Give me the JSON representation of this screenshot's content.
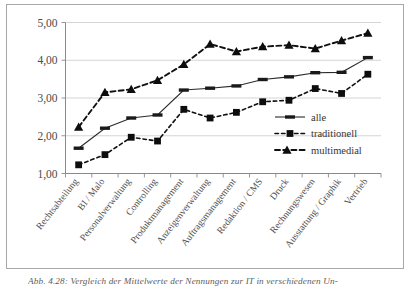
{
  "figure": {
    "caption": "Abb. 4.28: Vergleich der Mittelwerte der Nennungen zur IT in verschiedenen Un-"
  },
  "chart_data": {
    "type": "line",
    "title": "",
    "xlabel": "",
    "ylabel": "",
    "ylim": [
      1.0,
      5.0
    ],
    "ytick_labels": [
      "1,00",
      "2,00",
      "3,00",
      "4,00",
      "5,00"
    ],
    "ytick_values": [
      1.0,
      2.0,
      3.0,
      4.0,
      5.0
    ],
    "grid": true,
    "legend_position": "inside-right-lower",
    "categories": [
      "Rechtsabteilung",
      "BI / Malo",
      "Personalverwaltung",
      "Controlling",
      "Produktmanagement",
      "Anzeigenverwaltung",
      "Auftragsmanagement",
      "Redaktion / CMS",
      "Druck",
      "Rechnungswesen",
      "Ausstattung / Graphik",
      "Vertrieb"
    ],
    "series": [
      {
        "name": "alle",
        "marker": "dash",
        "line_style": "solid",
        "color": "#2b2b2b",
        "values": [
          1.67,
          2.2,
          2.47,
          2.55,
          3.21,
          3.26,
          3.32,
          3.49,
          3.56,
          3.67,
          3.68,
          4.07
        ]
      },
      {
        "name": "traditionell",
        "marker": "square",
        "line_style": "dotted",
        "color": "#101010",
        "values": [
          1.23,
          1.5,
          1.96,
          1.86,
          2.7,
          2.47,
          2.62,
          2.9,
          2.94,
          3.25,
          3.12,
          3.63
        ]
      },
      {
        "name": "multimedial",
        "marker": "triangle",
        "line_style": "dashed",
        "color": "#101010",
        "values": [
          2.23,
          3.15,
          3.23,
          3.47,
          3.89,
          4.43,
          4.23,
          4.36,
          4.4,
          4.31,
          4.52,
          4.72
        ]
      }
    ]
  }
}
